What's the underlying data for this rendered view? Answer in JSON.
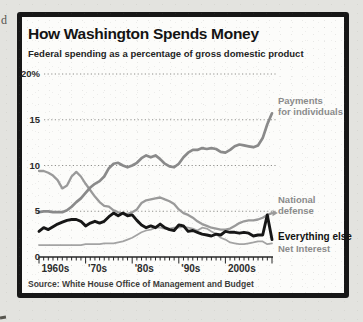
{
  "page": {
    "margin_text_fragment": "d"
  },
  "chart_data": {
    "type": "line",
    "title": "How Washington Spends Money",
    "subtitle": "Federal spending as a percentage of gross domestic product",
    "source": "Source: White House Office of Management and Budget",
    "grid": "horizontal-dotted",
    "legend_position": "right-end-of-line-labels",
    "xlim": [
      1960,
      2010
    ],
    "ylim": [
      0,
      20
    ],
    "yticks": [
      {
        "value": 0,
        "label": "0"
      },
      {
        "value": 5,
        "label": "5"
      },
      {
        "value": 10,
        "label": "10"
      },
      {
        "value": 15,
        "label": "15"
      },
      {
        "value": 20,
        "label": "20%"
      }
    ],
    "xticks": [
      {
        "value": 1960,
        "label": "1960s"
      },
      {
        "value": 1970,
        "label": "'70s"
      },
      {
        "value": 1980,
        "label": "'80s"
      },
      {
        "value": 1990,
        "label": "'90s"
      },
      {
        "value": 2000,
        "label": "2000s"
      }
    ],
    "x": [
      1960,
      1961,
      1962,
      1963,
      1964,
      1965,
      1966,
      1967,
      1968,
      1969,
      1970,
      1971,
      1972,
      1973,
      1974,
      1975,
      1976,
      1977,
      1978,
      1979,
      1980,
      1981,
      1982,
      1983,
      1984,
      1985,
      1986,
      1987,
      1988,
      1989,
      1990,
      1991,
      1992,
      1993,
      1994,
      1995,
      1996,
      1997,
      1998,
      1999,
      2000,
      2001,
      2002,
      2003,
      2004,
      2005,
      2006,
      2007,
      2008,
      2009,
      2010
    ],
    "series": [
      {
        "name": "Payments for individuals",
        "label_lines": [
          "Payments",
          "for individuals"
        ],
        "color": "#8a8a8a",
        "width": 2.7,
        "z": 3,
        "values": [
          4.9,
          5.0,
          5.0,
          4.9,
          4.9,
          4.9,
          5.1,
          5.5,
          6.0,
          6.4,
          7.0,
          7.6,
          8.0,
          8.3,
          8.8,
          9.7,
          10.2,
          10.3,
          10.0,
          9.8,
          10.0,
          10.3,
          10.8,
          11.1,
          10.9,
          11.1,
          10.7,
          10.2,
          9.9,
          9.8,
          10.2,
          10.9,
          11.4,
          11.7,
          11.7,
          11.9,
          11.8,
          11.9,
          11.8,
          11.5,
          11.4,
          11.7,
          12.1,
          12.3,
          12.2,
          12.1,
          12.0,
          12.2,
          13.0,
          14.5,
          15.7
        ]
      },
      {
        "name": "National defense",
        "label_lines": [
          "National",
          "defense"
        ],
        "color": "#9a9a9a",
        "width": 2.3,
        "z": 2,
        "arrow_end": true,
        "values": [
          9.4,
          9.4,
          9.2,
          8.9,
          8.4,
          7.5,
          7.8,
          8.8,
          9.3,
          8.8,
          8.0,
          7.3,
          6.6,
          6.0,
          5.6,
          5.5,
          5.1,
          4.9,
          4.7,
          4.7,
          4.9,
          5.2,
          5.9,
          6.2,
          6.3,
          6.4,
          6.5,
          6.3,
          6.1,
          5.8,
          5.2,
          4.8,
          4.6,
          4.3,
          3.9,
          3.6,
          3.4,
          3.2,
          3.1,
          3.0,
          3.0,
          3.1,
          3.4,
          3.7,
          3.9,
          4.0,
          4.0,
          4.1,
          4.3,
          4.6,
          4.8
        ]
      },
      {
        "name": "Everything else",
        "label_lines": [
          "Everything else"
        ],
        "color": "#161616",
        "width": 2.9,
        "z": 4,
        "values": [
          2.8,
          3.2,
          3.0,
          3.3,
          3.6,
          3.8,
          4.0,
          4.1,
          4.1,
          3.9,
          3.4,
          3.7,
          3.9,
          3.7,
          3.9,
          4.4,
          4.8,
          4.5,
          4.8,
          4.5,
          4.6,
          4.0,
          3.5,
          3.2,
          3.4,
          3.2,
          3.6,
          3.2,
          3.0,
          2.9,
          3.5,
          3.4,
          2.8,
          2.9,
          2.7,
          2.5,
          2.4,
          2.3,
          2.5,
          2.4,
          2.8,
          2.7,
          2.7,
          2.6,
          2.7,
          2.6,
          2.3,
          2.4,
          2.4,
          4.6,
          1.9
        ]
      },
      {
        "name": "Net Interest",
        "label_lines": [
          "Net Interest"
        ],
        "color": "#a3a3a3",
        "width": 1.7,
        "z": 1,
        "values": [
          1.3,
          1.3,
          1.3,
          1.3,
          1.3,
          1.3,
          1.3,
          1.3,
          1.3,
          1.3,
          1.4,
          1.4,
          1.4,
          1.4,
          1.5,
          1.5,
          1.5,
          1.6,
          1.7,
          1.9,
          2.1,
          2.4,
          2.7,
          2.9,
          3.0,
          3.2,
          3.2,
          3.1,
          3.1,
          3.2,
          3.2,
          3.3,
          3.2,
          3.1,
          2.9,
          3.2,
          3.1,
          2.8,
          2.5,
          2.1,
          1.9,
          1.6,
          1.5,
          1.4,
          1.4,
          1.5,
          1.6,
          1.7,
          1.7,
          1.4,
          1.5
        ]
      }
    ]
  }
}
